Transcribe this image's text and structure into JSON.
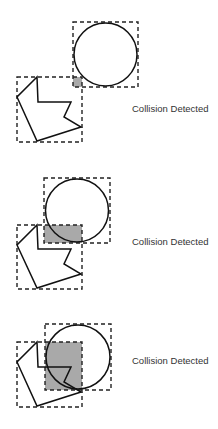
{
  "diagram": {
    "title": "",
    "panels": [
      {
        "id": "panel-1",
        "status_label": "Collision Detected",
        "circle_box": {
          "x": 73,
          "y": 22,
          "w": 65,
          "h": 65
        },
        "polygon_box": {
          "x": 17,
          "y": 77,
          "w": 65,
          "h": 65
        },
        "overlap": {
          "x": 73,
          "y": 77,
          "w": 9,
          "h": 10
        }
      },
      {
        "id": "panel-2",
        "status_label": "Collision Detected",
        "circle_box": {
          "x": 44,
          "y": 178,
          "w": 66,
          "h": 65
        },
        "polygon_box": {
          "x": 17,
          "y": 225,
          "w": 65,
          "h": 64
        },
        "overlap": {
          "x": 44,
          "y": 225,
          "w": 38,
          "h": 18
        }
      },
      {
        "id": "panel-3",
        "status_label": "Collision Detected",
        "circle_box": {
          "x": 45,
          "y": 324,
          "w": 66,
          "h": 66
        },
        "polygon_box": {
          "x": 17,
          "y": 342,
          "w": 65,
          "h": 65
        },
        "overlap": {
          "x": 45,
          "y": 342,
          "w": 37,
          "h": 48
        }
      }
    ],
    "colors": {
      "overlap_fill": "#a9a9a9",
      "outline": "#111111",
      "label": "#333333"
    }
  }
}
